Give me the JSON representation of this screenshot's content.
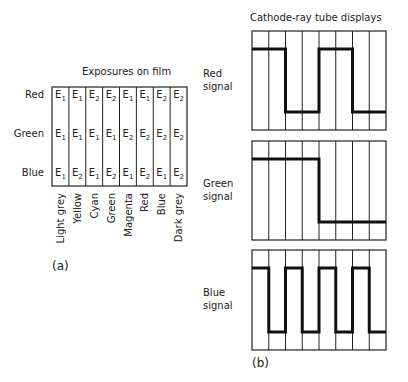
{
  "panel_a": {
    "title": "Exposures on film",
    "label": "(a)",
    "rows": [
      {
        "name": "Red",
        "cells": [
          "E1",
          "E1",
          "E2",
          "E2",
          "E1",
          "E1",
          "E2",
          "E2"
        ]
      },
      {
        "name": "Green",
        "cells": [
          "E1",
          "E1",
          "E1",
          "E1",
          "E2",
          "E2",
          "E2",
          "E2"
        ]
      },
      {
        "name": "Blue",
        "cells": [
          "E1",
          "E2",
          "E1",
          "E2",
          "E1",
          "E2",
          "E1",
          "E2"
        ]
      }
    ],
    "columns": [
      "Light grey",
      "Yellow",
      "Cyan",
      "Green",
      "Magenta",
      "Red",
      "Blue",
      "Dark grey"
    ]
  },
  "panel_b": {
    "title": "Cathode-ray tube displays",
    "label": "(b)",
    "signals": [
      {
        "name_line1": "Red",
        "name_line2": "signal",
        "levels": [
          1,
          1,
          0,
          0,
          1,
          1,
          0,
          0
        ]
      },
      {
        "name_line1": "Green",
        "name_line2": "signal",
        "levels": [
          1,
          1,
          1,
          1,
          0,
          0,
          0,
          0
        ]
      },
      {
        "name_line1": "Blue",
        "name_line2": "signal",
        "levels": [
          1,
          0,
          1,
          0,
          1,
          0,
          1,
          0
        ]
      }
    ]
  }
}
